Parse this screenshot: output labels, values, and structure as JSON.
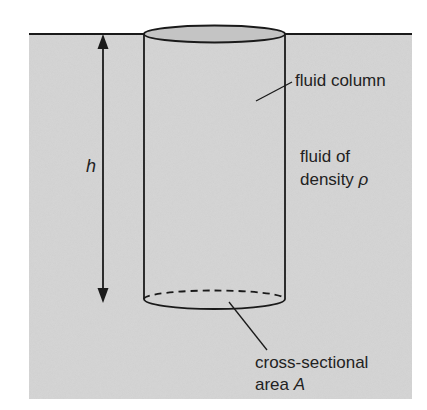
{
  "diagram": {
    "labels": {
      "height": "h",
      "fluid_column": "fluid column",
      "fluid_of": "fluid of",
      "density_prefix": "density",
      "density_symbol": "ρ",
      "cross_sectional": "cross-sectional",
      "area_prefix": "area",
      "area_symbol": "A"
    },
    "colors": {
      "fluid": "#d4d4d4",
      "cap": "#c2c2c2",
      "line": "#1a1a1a",
      "background": "#ffffff"
    }
  }
}
